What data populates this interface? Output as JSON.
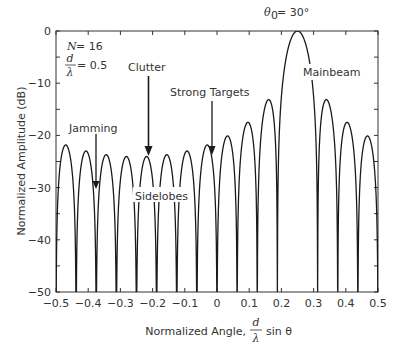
{
  "chart_data": {
    "type": "line",
    "title": "",
    "xlabel": "Normalized Angle, d/λ sin θ",
    "xlabel_parts": {
      "prefix": "Normalized Angle,",
      "frac_num": "d",
      "frac_den": "λ",
      "suffix": "sin θ"
    },
    "ylabel": "Normalized Amplitude (dB)",
    "xlim": [
      -0.5,
      0.5
    ],
    "ylim": [
      -50,
      0
    ],
    "xticks": [
      -0.5,
      -0.4,
      -0.3,
      -0.2,
      -0.1,
      0,
      0.1,
      0.2,
      0.3,
      0.4,
      0.5
    ],
    "xtick_labels": [
      "−0.5",
      "−0.4",
      "−0.3",
      "−0.2",
      "−0.1",
      "0",
      "0.1",
      "0.2",
      "0.3",
      "0.4",
      "0.5"
    ],
    "yticks": [
      0,
      -10,
      -20,
      -30,
      -40,
      -50
    ],
    "ytick_labels": [
      "0",
      "−10",
      "−20",
      "−30",
      "−40",
      "−50"
    ],
    "grid": false,
    "series": [
      {
        "name": "Array pattern (uniform linear array)",
        "model": "20*log10(|sin(N*pi*(u-u0))/(N*sin(pi*(u-u0)))|)",
        "N": 16,
        "d_over_lambda": 0.5,
        "steer_u0": 0.25,
        "steer_angle_deg": 30,
        "floor_db": -50,
        "mainbeam_peak": {
          "x": 0.25,
          "y": 0
        },
        "sidelobe_peaks_approx": [
          {
            "x": -0.47,
            "y": -22
          },
          {
            "x": -0.41,
            "y": -24
          },
          {
            "x": -0.35,
            "y": -24
          },
          {
            "x": -0.28,
            "y": -24
          },
          {
            "x": -0.22,
            "y": -24
          },
          {
            "x": -0.16,
            "y": -24
          },
          {
            "x": -0.1,
            "y": -23.5
          },
          {
            "x": -0.03,
            "y": -22.5
          },
          {
            "x": 0.03,
            "y": -21
          },
          {
            "x": 0.09,
            "y": -19
          },
          {
            "x": 0.16,
            "y": -16
          },
          {
            "x": 0.34,
            "y": -13
          },
          {
            "x": 0.41,
            "y": -18
          },
          {
            "x": 0.47,
            "y": -21
          }
        ]
      }
    ],
    "annotations": [
      {
        "id": "steer",
        "text_sym": "θ",
        "text_sub": "0",
        "text_rest": "= 30°"
      },
      {
        "id": "params_n",
        "text_sym": "N",
        "text_rest": " = 16"
      },
      {
        "id": "params_d",
        "frac_num": "d",
        "frac_den": "λ",
        "text_rest": "= 0.5"
      },
      {
        "id": "clutter",
        "text": "Clutter",
        "arrow_to_x": -0.23
      },
      {
        "id": "strong_targets",
        "text": "Strong Targets",
        "arrow_to_x": -0.02
      },
      {
        "id": "jamming",
        "text": "Jamming",
        "arrow_to_x": -0.39
      },
      {
        "id": "sidelobes",
        "text": "Sidelobes"
      },
      {
        "id": "mainbeam",
        "text": "Mainbeam"
      }
    ],
    "legend": null
  },
  "style": {
    "line_color": "#1a1a1a",
    "axis_color": "#333333",
    "text_color": "#333333",
    "background": "#ffffff"
  }
}
